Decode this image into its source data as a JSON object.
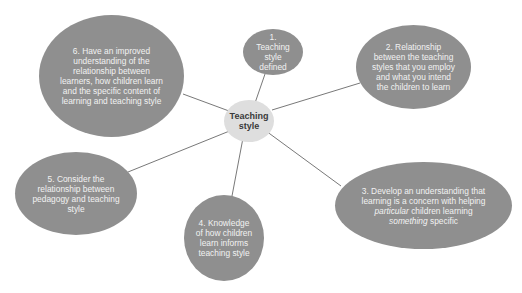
{
  "diagram": {
    "type": "mind-map",
    "center": {
      "label": "Teaching style"
    },
    "nodes": [
      {
        "id": 1,
        "lines": [
          "1.",
          "Teaching",
          "style",
          "defined"
        ]
      },
      {
        "id": 2,
        "lines": [
          "2. Relationship",
          "between the teaching",
          "styles that you employ",
          "and what you intend",
          "the children to learn"
        ]
      },
      {
        "id": 3,
        "lines": [
          "3. Develop an understanding that",
          "learning is a concern with helping",
          "particular children learning",
          "something specific"
        ],
        "italic_words": [
          "particular",
          "something"
        ]
      },
      {
        "id": 4,
        "lines": [
          "4. Knowledge",
          "of how children",
          "learn informs",
          "teaching style"
        ]
      },
      {
        "id": 5,
        "lines": [
          "5. Consider the",
          "relationship between",
          "pedagogy and teaching",
          "style"
        ]
      },
      {
        "id": 6,
        "lines": [
          "6. Have an improved",
          "understanding of the",
          "relationship between",
          "learners, how children learn",
          "and the specific content of",
          "learning and teaching style"
        ]
      }
    ],
    "colors": {
      "node_fill": "#8f8f8f",
      "center_fill": "#dedede",
      "line": "#555555",
      "node_text": "#f2f2f2",
      "center_text": "#3a3a3a"
    }
  }
}
